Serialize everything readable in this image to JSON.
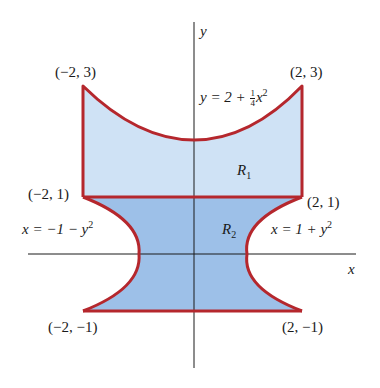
{
  "diagram": {
    "axes": {
      "x_label": "x",
      "y_label": "y"
    },
    "points": {
      "top_left": "(−2, 3)",
      "top_right": "(2, 3)",
      "mid_left": "(−2, 1)",
      "mid_right": "(2, 1)",
      "bottom_left": "(−2, −1)",
      "bottom_right": "(2, −1)"
    },
    "curves": {
      "top": {
        "lhs": "y = 2 + ",
        "num": "1",
        "den": "4",
        "var": "x",
        "exp": "2"
      },
      "left": {
        "text": "x = −1 − y",
        "exp": "2"
      },
      "right": {
        "text": "x = 1 + y",
        "exp": "2"
      }
    },
    "regions": {
      "r1": {
        "letter": "R",
        "sub": "1"
      },
      "r2": {
        "letter": "R",
        "sub": "2"
      }
    },
    "colors": {
      "boundary": "#b5272d",
      "region1_fill": "#cfe2f5",
      "region2_fill": "#9dc0e8",
      "axis": "#1a1a1a"
    }
  }
}
